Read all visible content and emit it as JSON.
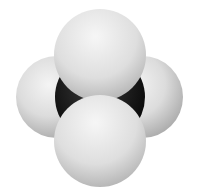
{
  "image": {
    "subject": "space-filling molecular model",
    "background": "#ffffff",
    "atoms": [
      {
        "role": "central",
        "color": "#141414",
        "cx": 100,
        "cy": 97,
        "r": 44
      },
      {
        "role": "left",
        "color": "#d8d8d8",
        "cx": 57,
        "cy": 97,
        "r": 41
      },
      {
        "role": "right",
        "color": "#d8d8d8",
        "cx": 142,
        "cy": 97,
        "r": 41
      },
      {
        "role": "top",
        "color": "#e2e2e2",
        "cx": 100,
        "cy": 55,
        "r": 46
      },
      {
        "role": "bottom",
        "color": "#e2e2e2",
        "cx": 100,
        "cy": 141,
        "r": 46
      }
    ]
  }
}
